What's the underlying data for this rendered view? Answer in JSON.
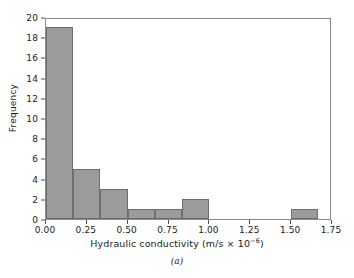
{
  "figure": {
    "caption": "(a)"
  },
  "chart_data": {
    "type": "bar",
    "title": "",
    "subtitle": "",
    "xlabel_text": "Hydraulic conductivity (m/s × 10",
    "xlabel_exponent": "−6",
    "xlabel_tail": ")",
    "xlabel": "Hydraulic conductivity (m/s × 10−6)",
    "ylabel": "Frequency",
    "xlim": [
      0.0,
      1.75
    ],
    "ylim": [
      0,
      20
    ],
    "grid": false,
    "legend": "none",
    "bin_width": 0.1667,
    "xticks": [
      0.0,
      0.25,
      0.5,
      0.75,
      1.0,
      1.25,
      1.5,
      1.75
    ],
    "xtick_labels": [
      "0.00",
      "0.25",
      "0.50",
      "0.75",
      "1.00",
      "1.25",
      "1.50",
      "1.75"
    ],
    "yticks": [
      0,
      2,
      4,
      6,
      8,
      10,
      12,
      14,
      16,
      18,
      20
    ],
    "ytick_labels": [
      "0",
      "2",
      "4",
      "6",
      "8",
      "10",
      "12",
      "14",
      "16",
      "18",
      "20"
    ],
    "bins": [
      {
        "left": 0.0,
        "right": 0.1667,
        "value": 19
      },
      {
        "left": 0.1667,
        "right": 0.3333,
        "value": 5
      },
      {
        "left": 0.3333,
        "right": 0.5,
        "value": 3
      },
      {
        "left": 0.5,
        "right": 0.6667,
        "value": 1
      },
      {
        "left": 0.6667,
        "right": 0.8333,
        "value": 1
      },
      {
        "left": 0.8333,
        "right": 1.0,
        "value": 2
      },
      {
        "left": 1.0,
        "right": 1.1667,
        "value": 0
      },
      {
        "left": 1.1667,
        "right": 1.3333,
        "value": 0
      },
      {
        "left": 1.3333,
        "right": 1.5,
        "value": 0
      },
      {
        "left": 1.5,
        "right": 1.6667,
        "value": 1
      }
    ],
    "categories": [
      "0.00-0.17",
      "0.17-0.33",
      "0.33-0.50",
      "0.50-0.67",
      "0.67-0.83",
      "0.83-1.00",
      "1.00-1.17",
      "1.17-1.33",
      "1.33-1.50",
      "1.50-1.67"
    ],
    "values": [
      19,
      5,
      3,
      1,
      1,
      2,
      0,
      0,
      0,
      1
    ],
    "colors": {
      "bar_fill": "#9b9b9b",
      "bar_edge": "#6e6e6e",
      "axis": "#8a8a8a",
      "text": "#1a1a1a",
      "background": "#ffffff"
    }
  }
}
